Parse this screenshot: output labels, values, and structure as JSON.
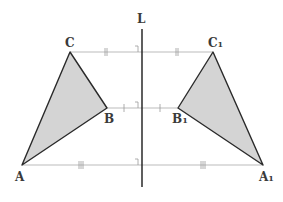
{
  "diagram": {
    "axis_label": "L",
    "original": {
      "A": "A",
      "B": "B",
      "C": "C",
      "points": {
        "A": [
          22,
          165
        ],
        "B": [
          107,
          108
        ],
        "C": [
          70,
          52
        ]
      }
    },
    "image": {
      "A": "A",
      "B": "B",
      "C": "C",
      "sub": "1",
      "points": {
        "A": [
          263,
          165
        ],
        "B": [
          178,
          108
        ],
        "C": [
          213,
          52
        ]
      }
    },
    "colors": {
      "fill": "#d4d4d4",
      "stroke": "#2a2a2a",
      "construction": "#aaaaaa",
      "axis": "#1a1a1a"
    },
    "tick_marks": {
      "CC1": "||",
      "BB1": "|",
      "AA1": "|||"
    }
  }
}
